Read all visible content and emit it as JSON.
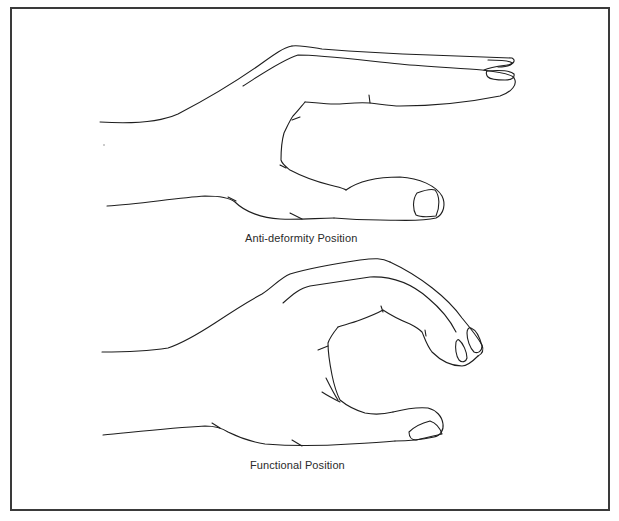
{
  "figure": {
    "panels": [
      {
        "id": "anti-deformity",
        "caption": "Anti-deformity Position",
        "description": "Hand drawn in side view: wrist extended, fingers straight and extended horizontally, thumb abducted below the fingers"
      },
      {
        "id": "functional",
        "caption": "Functional Position",
        "description": "Hand drawn in side view: wrist slightly extended, fingers flexed in a gentle curve, thumb opposed forming a C-shape grip"
      }
    ],
    "colors": {
      "line": "#1e1e1e",
      "border": "#3a3a3a",
      "background": "#ffffff",
      "caption_text": "#2a2a2a"
    }
  }
}
